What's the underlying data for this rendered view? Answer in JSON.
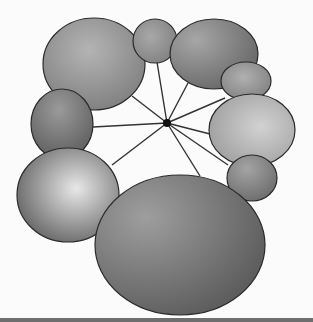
{
  "diagram": {
    "type": "hub-and-spoke",
    "background": "#fbfbfb",
    "hub": {
      "cx": 167,
      "cy": 123,
      "r": 4,
      "color": "#111111"
    },
    "spoke_color": "#333333",
    "outline_color": "#2a2a2a",
    "nodes": [
      {
        "id": "top-left-large",
        "cx": 94,
        "cy": 64,
        "rx": 51,
        "ry": 46,
        "light": "#b4b4b4",
        "dark": "#7a7a7a",
        "gx": 0.45,
        "gy": 0.35
      },
      {
        "id": "top-center-small",
        "cx": 155,
        "cy": 41,
        "rx": 22,
        "ry": 22,
        "light": "#a8a8a8",
        "dark": "#7c7c7c",
        "gx": 0.4,
        "gy": 0.4
      },
      {
        "id": "top-right",
        "cx": 214,
        "cy": 54,
        "rx": 44,
        "ry": 35,
        "light": "#a6a6a6",
        "dark": "#6a6a6a",
        "gx": 0.3,
        "gy": 0.3
      },
      {
        "id": "right-small",
        "cx": 246,
        "cy": 81,
        "rx": 25,
        "ry": 19,
        "light": "#b0b0b0",
        "dark": "#7a7a7a",
        "gx": 0.45,
        "gy": 0.4
      },
      {
        "id": "right-large-light",
        "cx": 252,
        "cy": 130,
        "rx": 43,
        "ry": 36,
        "light": "#d2d2d2",
        "dark": "#979797",
        "gx": 0.6,
        "gy": 0.45
      },
      {
        "id": "right-lower-small",
        "cx": 252,
        "cy": 178,
        "rx": 25,
        "ry": 23,
        "light": "#a4a4a4",
        "dark": "#6c6c6c",
        "gx": 0.4,
        "gy": 0.3
      },
      {
        "id": "left-mid",
        "cx": 62,
        "cy": 124,
        "rx": 31,
        "ry": 35,
        "light": "#9a9a9a",
        "dark": "#5c5c5c",
        "gx": 0.45,
        "gy": 0.3
      },
      {
        "id": "left-bottom-large",
        "cx": 68,
        "cy": 195,
        "rx": 51,
        "ry": 47,
        "light": "#e8e8e8",
        "dark": "#4e4e4e",
        "gx": 0.58,
        "gy": 0.43
      },
      {
        "id": "bottom-large",
        "cx": 180,
        "cy": 245,
        "rx": 85,
        "ry": 70,
        "light": "#9e9e9e",
        "dark": "#5e5e5e",
        "gx": 0.3,
        "gy": 0.3
      }
    ],
    "spokes": [
      {
        "to": "top-center-small",
        "x2": 157,
        "y2": 62
      },
      {
        "to": "top-left-large",
        "x2": 132,
        "y2": 96
      },
      {
        "to": "top-right",
        "x2": 188,
        "y2": 83
      },
      {
        "to": "right-small",
        "x2": 225,
        "y2": 98
      },
      {
        "to": "right-large-light",
        "x2": 210,
        "y2": 134
      },
      {
        "to": "right-lower-small",
        "x2": 228,
        "y2": 165
      },
      {
        "to": "left-mid",
        "x2": 93,
        "y2": 127
      },
      {
        "to": "left-bottom-large",
        "x2": 112,
        "y2": 165
      },
      {
        "to": "bottom-large",
        "x2": 200,
        "y2": 176
      }
    ],
    "bottom_rule_color": "#6e6e6e"
  }
}
